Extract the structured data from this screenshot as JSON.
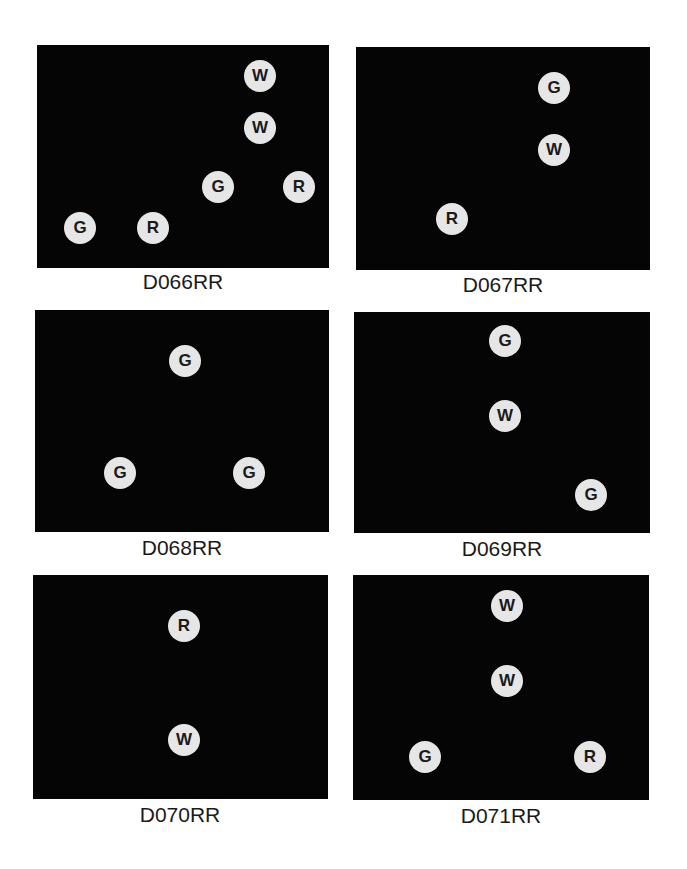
{
  "panels": [
    {
      "label": "D066RR",
      "markers": [
        {
          "letter": "W"
        },
        {
          "letter": "W"
        },
        {
          "letter": "G"
        },
        {
          "letter": "R"
        },
        {
          "letter": "G"
        },
        {
          "letter": "R"
        }
      ]
    },
    {
      "label": "D067RR",
      "markers": [
        {
          "letter": "G"
        },
        {
          "letter": "W"
        },
        {
          "letter": "R"
        }
      ]
    },
    {
      "label": "D068RR",
      "markers": [
        {
          "letter": "G"
        },
        {
          "letter": "G"
        },
        {
          "letter": "G"
        }
      ]
    },
    {
      "label": "D069RR",
      "markers": [
        {
          "letter": "G"
        },
        {
          "letter": "W"
        },
        {
          "letter": "G"
        }
      ]
    },
    {
      "label": "D070RR",
      "markers": [
        {
          "letter": "R"
        },
        {
          "letter": "W"
        }
      ]
    },
    {
      "label": "D071RR",
      "markers": [
        {
          "letter": "W"
        },
        {
          "letter": "W"
        },
        {
          "letter": "G"
        },
        {
          "letter": "R"
        }
      ]
    }
  ],
  "colors": {
    "panel_background": "#050505",
    "marker_fill": "#e6e6e6",
    "marker_text": "#1a1a1a",
    "page_background": "#ffffff"
  }
}
